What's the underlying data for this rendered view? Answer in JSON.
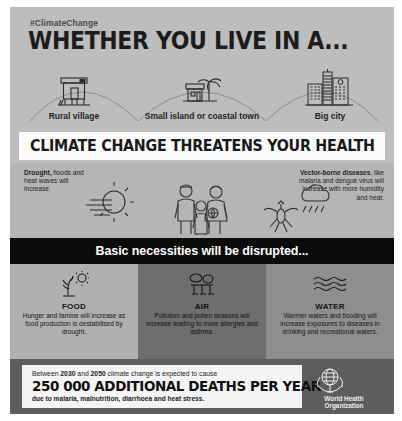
{
  "poster": {
    "hashtag": "#ClimateChange",
    "headline": "WHETHER YOU LIVE IN A...",
    "banner": "CLIMATE CHANGE THREATENS YOUR HEALTH",
    "disrupted_bar": "Basic necessities will be disrupted..."
  },
  "scenarios": [
    {
      "label": "Rural village",
      "icon": "stilt-house-icon"
    },
    {
      "label": "Small island or coastal town",
      "icon": "palm-house-icon"
    },
    {
      "label": "Big city",
      "icon": "skyscrapers-icon"
    }
  ],
  "impacts": {
    "left": {
      "lead": "Drought,",
      "rest": " floods and heat waves will increase.",
      "icon": "sun-heatwave-icon"
    },
    "right": {
      "lead": "Vector-borne diseases",
      "rest": ", like malaria and dengue virus will increase with more humidity and heat.",
      "icon": "mosquito-raincloud-icon"
    },
    "center_icon": "family-icon"
  },
  "necessities": [
    {
      "title": "FOOD",
      "text": "Hunger and famine will increase as food production is destabilised by drought.",
      "icon": "withered-plant-sun-icon"
    },
    {
      "title": "AIR",
      "text": "Pollution and pollen seasons will increase leading to more allergies and asthma.",
      "icon": "smog-factory-icon"
    },
    {
      "title": "WATER",
      "text": "Warmer waters and flooding will increase exposures to diseases in drinking and recreational waters.",
      "icon": "waves-icon"
    }
  ],
  "footer": {
    "pre_a": "Between ",
    "year_start": "2030",
    "pre_b": " and ",
    "year_end": "2050",
    "pre_c": " climate change is expected to cause",
    "headline": "250 000 ADDITIONAL DEATHS PER YEAR",
    "post": "due to malaria, malnutrition, diarrhoea and heat stress.",
    "logo_name": "World Health\nOrganization",
    "logo_icon": "who-emblem-icon"
  },
  "colors": {
    "paper": "#bdbdbd",
    "banner_bg": "#fbfbfb",
    "black_bar": "#0b0b0b",
    "col_food": "#b0b0b0",
    "col_air": "#6e6e6e",
    "col_water": "#8e8e8e",
    "footer_bg": "#5d5d5d",
    "ink": "#1c1c1c"
  }
}
